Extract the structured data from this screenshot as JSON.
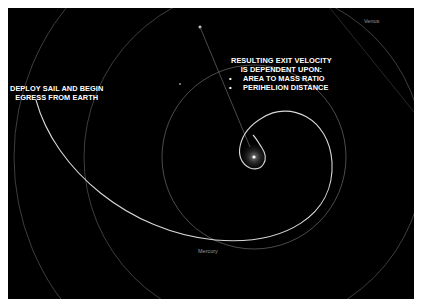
{
  "diagram": {
    "background_color": "#000000",
    "annotations": {
      "deploy": {
        "line1": "DEPLOY SAIL AND BEGIN",
        "line2": "EGRESS FROM EARTH"
      },
      "exit_velocity": {
        "line1": "RESULTING EXIT VELOCITY",
        "line2": "IS DEPENDENT UPON:",
        "bullets": [
          "AREA TO MASS RATIO",
          "PERIHELION DISTANCE"
        ]
      }
    },
    "bodies": {
      "sun": {
        "name": "Sun",
        "cx": 254,
        "cy": 157
      },
      "planets": [
        {
          "name": "Mercury",
          "label": "Mercury",
          "orbit_radius": 92
        },
        {
          "name": "Venus",
          "label": "Venus",
          "orbit_radius": 170
        },
        {
          "name": "Earth",
          "label": "",
          "orbit_radius": 240
        }
      ]
    },
    "colors": {
      "orbit": "#5a5a5a",
      "trajectory": "#d8d8d8",
      "text": "#ffffff",
      "planet_label": "#9a9a9a"
    }
  }
}
